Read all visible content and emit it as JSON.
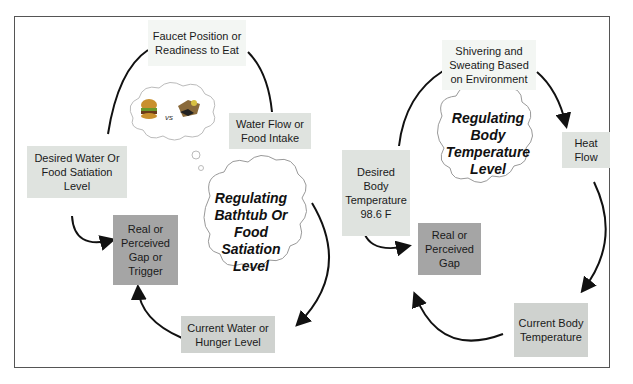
{
  "left_loop": {
    "title": "Regulating Bathtub Or Food Satiation Level",
    "title_lines": [
      "Regulating",
      "Bathtub Or",
      "Food",
      "Satiation",
      "Level"
    ],
    "nodes": {
      "action": "Faucet Position or Readiness to Eat",
      "flow": "Water Flow or Food Intake",
      "desired": "Desired Water Or Food Satiation Level",
      "gap": "Real or Perceived Gap or Trigger",
      "current": "Current Water or Hunger Level"
    },
    "thought_bubble": {
      "left_icon": "hamburger-icon",
      "separator": "vs",
      "right_icon": "healthy-meal-icon"
    }
  },
  "right_loop": {
    "title": "Regulating Body Temperature Level",
    "title_lines": [
      "Regulating",
      "Body",
      "Temperature",
      "Level"
    ],
    "nodes": {
      "action": "Shivering and Sweating Based on Environment",
      "flow": "Heat Flow",
      "desired": "Desired Body Temperature 98.6 F",
      "gap": "Real or Perceived Gap",
      "current": "Current Body Temperature"
    }
  },
  "colors": {
    "frame": "#555555",
    "light_box": "#dfe3df",
    "gap_box": "#a5a5a5",
    "current_box": "#cfd2cf",
    "arrow": "#111111"
  }
}
